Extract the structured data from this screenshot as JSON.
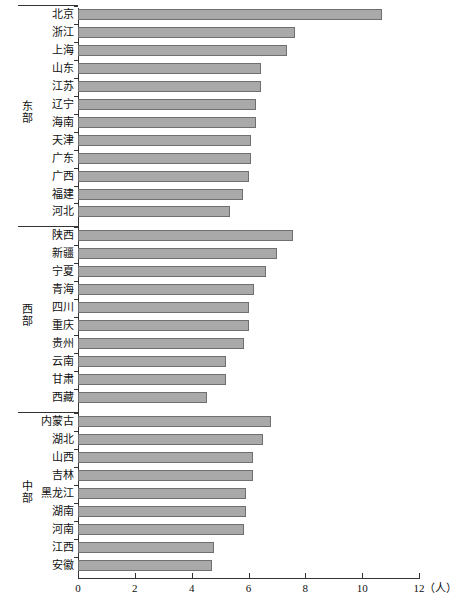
{
  "chart_data": {
    "type": "bar",
    "orientation": "horizontal",
    "title": "",
    "xlabel": "（人）",
    "ylabel": "",
    "xlim": [
      0,
      12
    ],
    "xticks": [
      0,
      2,
      4,
      6,
      8,
      10,
      12
    ],
    "xtick_labels": [
      "0",
      "2",
      "4",
      "6",
      "8",
      "10",
      "12"
    ],
    "grid": false,
    "legend": false,
    "groups": [
      {
        "name": "东部",
        "categories": [
          "北京",
          "浙江",
          "上海",
          "山东",
          "江苏",
          "辽宁",
          "海南",
          "天津",
          "广东",
          "广西",
          "福建",
          "河北"
        ],
        "values": [
          10.7,
          7.65,
          7.35,
          6.45,
          6.45,
          6.25,
          6.25,
          6.1,
          6.1,
          6.0,
          5.8,
          5.35
        ]
      },
      {
        "name": "西部",
        "categories": [
          "陕西",
          "新疆",
          "宁夏",
          "青海",
          "四川",
          "重庆",
          "贵州",
          "云南",
          "甘肃",
          "西藏"
        ],
        "values": [
          7.55,
          7.0,
          6.6,
          6.2,
          6.0,
          6.0,
          5.85,
          5.2,
          5.2,
          4.55
        ]
      },
      {
        "name": "中部",
        "categories": [
          "内蒙古",
          "湖北",
          "山西",
          "吉林",
          "黑龙江",
          "湖南",
          "河南",
          "江西",
          "安徽"
        ],
        "values": [
          6.8,
          6.5,
          6.15,
          6.15,
          5.9,
          5.9,
          5.85,
          4.8,
          4.7
        ]
      }
    ]
  },
  "axis": {
    "unit_text": "（人）"
  }
}
